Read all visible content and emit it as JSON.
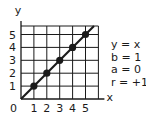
{
  "chart_data": {
    "type": "scatter",
    "title": "",
    "xlabel": "x",
    "ylabel": "y",
    "origin_label": "0",
    "x_ticks": [
      "1",
      "2",
      "3",
      "4",
      "5"
    ],
    "y_ticks": [
      "1",
      "2",
      "3",
      "4",
      "5"
    ],
    "xlim": [
      0,
      6
    ],
    "ylim": [
      0,
      5.6
    ],
    "grid": true,
    "points": [
      {
        "x": 1,
        "y": 1
      },
      {
        "x": 2,
        "y": 2
      },
      {
        "x": 3,
        "y": 3
      },
      {
        "x": 4,
        "y": 4
      },
      {
        "x": 5,
        "y": 5
      }
    ],
    "line": {
      "equation": "y = x",
      "slope": 1,
      "intercept": 0
    },
    "annotations": [
      "y = x",
      "b = 1",
      "a = 0",
      "r = +1"
    ]
  },
  "legend": {
    "equation": "y = x",
    "slope": "b = 1",
    "intercept": "a = 0",
    "correlation": "r = +1"
  },
  "colors": {
    "ink": "#1a1a1a",
    "background": "#ffffff"
  }
}
